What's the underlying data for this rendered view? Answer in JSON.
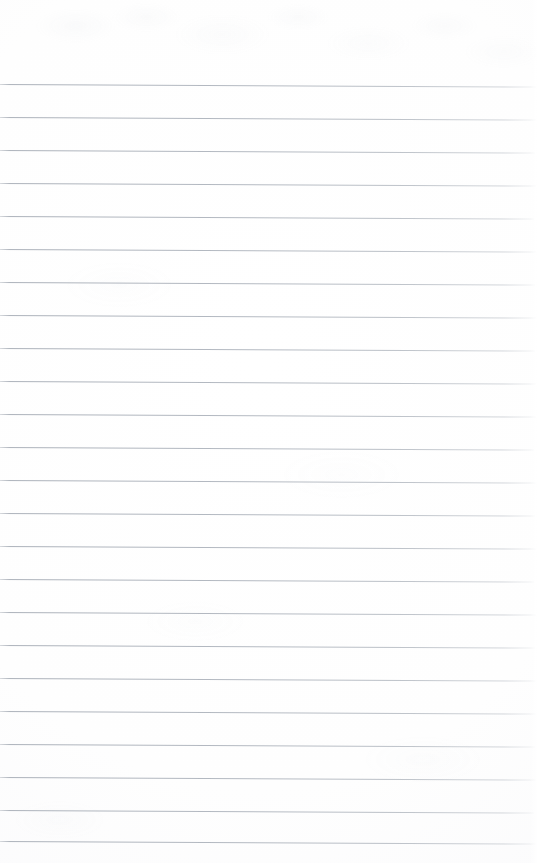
{
  "document": {
    "kind": "scanned-ruled-notebook-page",
    "title": "Blank Ruled Notebook Page",
    "orientation": "portrait",
    "page_width_px": 542,
    "page_height_px": 863,
    "background_color": "#fdfdfd",
    "text_content": "",
    "has_handwriting": false,
    "has_printed_text": false,
    "margin_top_px": 84,
    "margin_bottom_px": 22
  },
  "ruling": {
    "style": "wide-ruled",
    "line_color": "#b0b6bf",
    "line_thickness_px": 1,
    "line_spacing_px": 33,
    "first_line_y_px": 84,
    "line_start_x_px": 0,
    "line_end_x_px": 536,
    "tilt_degrees": 0.28,
    "line_count": 24,
    "line_y_positions": [
      84,
      117,
      150,
      183,
      216,
      249,
      282,
      315,
      348,
      381,
      414,
      447,
      480,
      513,
      546,
      579,
      612,
      645,
      678,
      711,
      744,
      777,
      810,
      841
    ],
    "line_widths_px": [
      536,
      536,
      535,
      536,
      534,
      536,
      535,
      536,
      535,
      536,
      536,
      534,
      536,
      535,
      536,
      534,
      536,
      535,
      536,
      536,
      535,
      536,
      534,
      536
    ]
  },
  "margin_rule": {
    "present": false
  },
  "annotations": []
}
